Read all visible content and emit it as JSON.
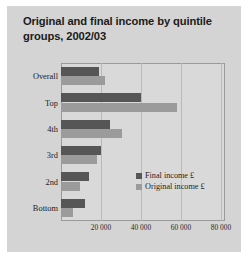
{
  "figure": {
    "title": "Original and final income by quintile groups, 2002/03",
    "background_color": "#d4d4d4",
    "plot_background_color": "#d9d9d9"
  },
  "legend": {
    "position": "inside-right",
    "items": [
      {
        "label": "Final income £",
        "color": "#565656",
        "swatch_name": "final-income"
      },
      {
        "label": "Original income £",
        "color": "#9b9b9b",
        "swatch_name": "original-income"
      }
    ]
  },
  "chart_data": {
    "type": "bar",
    "orientation": "horizontal",
    "title": "Original and final income by quintile groups, 2002/03",
    "xlabel": "",
    "ylabel": "",
    "categories": [
      "Overall",
      "Top",
      "4th",
      "3rd",
      "2nd",
      "Bottom"
    ],
    "series": [
      {
        "name": "Final income £",
        "color": "#565656",
        "values": [
          19000,
          40000,
          24500,
          20000,
          14000,
          12000
        ]
      },
      {
        "name": "Original income £",
        "color": "#9b9b9b",
        "values": [
          22000,
          58000,
          30500,
          18000,
          9500,
          6000
        ]
      }
    ],
    "xlim": [
      0,
      82000
    ],
    "xticks": [
      20000,
      40000,
      60000,
      80000
    ],
    "xtick_labels": [
      "20 000",
      "40 000",
      "60 000",
      "80 000"
    ],
    "grid": "vertical"
  }
}
